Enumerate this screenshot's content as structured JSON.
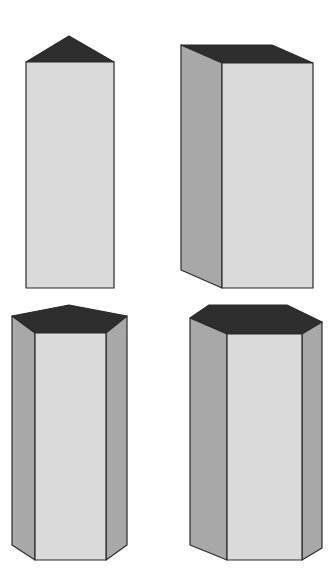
{
  "diagram": {
    "colors": {
      "top_face": "#2e2e2e",
      "side_face": "#a8a8a8",
      "front_face": "#dadada",
      "edge": "#2a2a2a",
      "background": "#ffffff"
    },
    "shapes": [
      {
        "name": "triangular-prism",
        "position": "top-left"
      },
      {
        "name": "rectangular-prism",
        "position": "top-right"
      },
      {
        "name": "pentagonal-prism",
        "position": "bottom-left"
      },
      {
        "name": "hexagonal-prism",
        "position": "bottom-right"
      }
    ]
  }
}
